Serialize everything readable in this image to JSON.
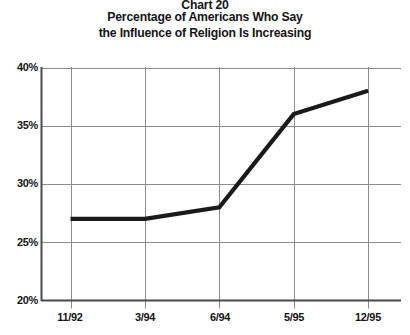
{
  "title": {
    "chart_number": "Chart 20",
    "line1": "Percentage of Americans Who Say",
    "line2": "the Influence of Religion Is Increasing"
  },
  "chart_data": {
    "type": "line",
    "xlabel": "",
    "ylabel": "",
    "categories": [
      "11/92",
      "3/94",
      "6/94",
      "5/95",
      "12/95"
    ],
    "values": [
      27,
      27,
      28,
      36,
      38
    ],
    "ylim": [
      20,
      40
    ],
    "ytick_labels": [
      "20%",
      "25%",
      "30%",
      "35%",
      "40%"
    ],
    "ytick_values": [
      20,
      25,
      30,
      35,
      40
    ],
    "grid": true,
    "legend": "none",
    "line_color": "#1a1a1a",
    "grid_color": "#8c8c8c",
    "axis_color": "#555555"
  }
}
